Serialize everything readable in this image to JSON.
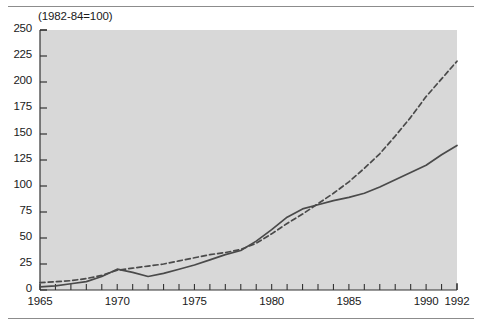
{
  "figure": {
    "note": "(1982-84=100)",
    "rules": {
      "top_label": "top-divider",
      "bottom_label": "bottom-divider"
    }
  },
  "chart_data": {
    "type": "line",
    "title": "",
    "subtitle": "(1982-84=100)",
    "xlabel": "",
    "ylabel": "",
    "xlim": [
      1965,
      1992
    ],
    "ylim": [
      0,
      250
    ],
    "ytick_step": 25,
    "yticks": [
      0,
      25,
      50,
      75,
      100,
      125,
      150,
      175,
      200,
      225,
      250
    ],
    "xticks": [
      1965,
      1970,
      1975,
      1980,
      1985,
      1990,
      1992
    ],
    "xtick_labels": [
      "1965",
      "1970",
      "1975",
      "1980",
      "1985",
      "1990",
      "1992"
    ],
    "xminor_ticks": [
      1966,
      1967,
      1968,
      1969,
      1971,
      1972,
      1973,
      1974,
      1976,
      1977,
      1978,
      1979,
      1981,
      1982,
      1983,
      1984,
      1986,
      1987,
      1988,
      1989,
      1991
    ],
    "grid": false,
    "legend": "none",
    "plot_background": "#d8d8d8",
    "line_color": "#4a4a4a",
    "x": [
      1965,
      1966,
      1967,
      1968,
      1969,
      1970,
      1971,
      1972,
      1973,
      1974,
      1975,
      1976,
      1977,
      1978,
      1979,
      1980,
      1981,
      1982,
      1983,
      1984,
      1985,
      1986,
      1987,
      1988,
      1989,
      1990,
      1991,
      1992
    ],
    "series": [
      {
        "name": "solid-series",
        "style": "solid",
        "color": "#4a4a4a",
        "values": [
          3,
          4,
          6,
          8,
          13,
          20,
          17,
          13,
          16,
          20,
          24,
          29,
          34,
          38,
          47,
          58,
          70,
          78,
          82,
          86,
          89,
          93,
          99,
          106,
          113,
          120,
          130,
          139
        ]
      },
      {
        "name": "dashed-series",
        "style": "dashed",
        "color": "#4a4a4a",
        "values": [
          7,
          8,
          9,
          11,
          14,
          19,
          21,
          23,
          25,
          28,
          31,
          34,
          36,
          39,
          45,
          54,
          64,
          73,
          83,
          93,
          104,
          117,
          131,
          148,
          166,
          186,
          203,
          220
        ]
      }
    ]
  }
}
